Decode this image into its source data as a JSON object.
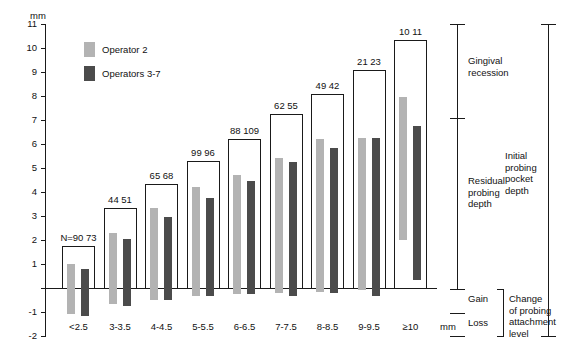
{
  "chart_data": {
    "type": "bar",
    "title": "",
    "xlabel": "mm",
    "ylabel": "mm",
    "ylim": [
      -2,
      11
    ],
    "yticks": [
      -2,
      -1,
      0,
      1,
      2,
      3,
      4,
      5,
      6,
      7,
      8,
      9,
      10,
      11
    ],
    "ytick_labels": [
      "-2",
      "-1",
      "",
      "1",
      "2",
      "3",
      "4",
      "5",
      "6",
      "7",
      "8",
      "9",
      "10",
      "11"
    ],
    "grid": false,
    "legend_position": "top-left",
    "categories": [
      "<2.5",
      "3-3.5",
      "4-4.5",
      "5-5.5",
      "6-6.5",
      "7-7.5",
      "8-8.5",
      "9-9.5",
      "≥10"
    ],
    "series": [
      {
        "name": "Operator 2",
        "color": "#b3b3b3",
        "n": [
          90,
          44,
          65,
          99,
          88,
          62,
          49,
          21,
          10
        ]
      },
      {
        "name": "Operators 3-7",
        "color": "#4b4b4b",
        "n": [
          73,
          51,
          68,
          96,
          109,
          55,
          42,
          23,
          11
        ]
      }
    ],
    "n_labels": [
      "N=90 73",
      "44 51",
      "65 68",
      "99 96",
      "88 109",
      "62 55",
      "49 42",
      "21 23",
      "10 11"
    ],
    "initial_pocket_depth_box_top": [
      1.75,
      3.35,
      4.35,
      5.3,
      6.2,
      7.25,
      8.1,
      9.1,
      10.35
    ],
    "bars": [
      {
        "category": "<2.5",
        "op2_top": 1.0,
        "op2_bottom": -1.1,
        "op37_top": 0.8,
        "op37_bottom": -1.15
      },
      {
        "category": "3-3.5",
        "op2_top": 2.3,
        "op2_bottom": -0.65,
        "op37_top": 2.05,
        "op37_bottom": -0.75
      },
      {
        "category": "4-4.5",
        "op2_top": 3.35,
        "op2_bottom": -0.5,
        "op37_top": 2.95,
        "op37_bottom": -0.5
      },
      {
        "category": "5-5.5",
        "op2_top": 4.2,
        "op2_bottom": -0.35,
        "op37_top": 3.75,
        "op37_bottom": -0.35
      },
      {
        "category": "6-6.5",
        "op2_top": 4.7,
        "op2_bottom": -0.25,
        "op37_top": 4.45,
        "op37_bottom": -0.25
      },
      {
        "category": "7-7.5",
        "op2_top": 5.4,
        "op2_bottom": -0.2,
        "op37_top": 5.25,
        "op37_bottom": -0.35
      },
      {
        "category": "8-8.5",
        "op2_top": 6.2,
        "op2_bottom": -0.15,
        "op37_top": 5.85,
        "op37_bottom": -0.2
      },
      {
        "category": "9-9.5",
        "op2_top": 6.25,
        "op2_bottom": -0.1,
        "op37_top": 6.25,
        "op37_bottom": -0.35
      },
      {
        "category": "≥10",
        "op2_top": 7.95,
        "op2_bottom": 2.0,
        "op37_top": 6.75,
        "op37_bottom": 0.35
      }
    ],
    "annotations": {
      "gingival_recession": "Gingival\nrecession",
      "residual_probing_depth": "Residual\nprobing\ndepth",
      "gain": "Gain",
      "loss": "Loss",
      "change_of_attachment": "Change\nof probing\nattachment\nlevel",
      "initial_probing_pocket_depth": "Initial\nprobing\npocket\ndepth",
      "axis_unit_top": "mm",
      "axis_unit_bottom": "mm"
    }
  }
}
